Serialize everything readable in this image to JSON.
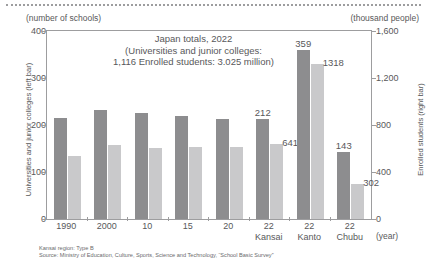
{
  "chart_data": {
    "type": "bar",
    "title": "Japan totals, 2022 (Universities and junior colleges: 1,116 Enrolled students: 3.025 million)",
    "title_lines": [
      "Japan totals, 2022",
      "(Universities and junior colleges:",
      "1,116 Enrolled students: 3.025 million)"
    ],
    "xlabel": "(year)",
    "unit_left": "(number of schools)",
    "unit_right": "(thousand people)",
    "ylabel_left": "Universities and junior colleges (left bar)",
    "ylabel_right": "Enrolled students (right bar)",
    "ylim_left": [
      0,
      400
    ],
    "ylim_right": [
      0,
      1600
    ],
    "yticks_left": [
      "0",
      "100",
      "200",
      "300",
      "400"
    ],
    "yticks_left_values": [
      0,
      100,
      200,
      300,
      400
    ],
    "yticks_right": [
      "0",
      "400",
      "800",
      "1,200",
      "1,600"
    ],
    "yticks_right_values": [
      0,
      400,
      800,
      1200,
      1600
    ],
    "grid": false,
    "legend_position": "none",
    "categories": [
      "1990",
      "2000",
      "10",
      "15",
      "20",
      "22",
      "22",
      "22"
    ],
    "category_sublabels": [
      "",
      "",
      "",
      "",
      "",
      "Kansai",
      "Kanto",
      "Chubu"
    ],
    "series": [
      {
        "name": "Universities and junior colleges (left bar)",
        "axis": "left",
        "color": "#8d8d8f",
        "values": [
          215,
          232,
          226,
          219,
          212,
          212,
          359,
          143
        ],
        "labels": [
          "",
          "",
          "",
          "",
          "",
          "212",
          "359",
          "143"
        ]
      },
      {
        "name": "Enrolled students (right bar)",
        "axis": "right",
        "color": "#c9c9cb",
        "values": [
          534,
          631,
          606,
          609,
          617,
          641,
          1318,
          302
        ],
        "labels": [
          "",
          "",
          "",
          "",
          "",
          "641",
          "1318",
          "302"
        ]
      }
    ],
    "annotations": [
      {
        "text": "359",
        "series": "left",
        "category_index": 6
      },
      {
        "text": "1318",
        "series": "right",
        "category_index": 6
      },
      {
        "text": "212",
        "series": "left",
        "category_index": 5
      },
      {
        "text": "641",
        "series": "right",
        "category_index": 5
      },
      {
        "text": "143",
        "series": "left",
        "category_index": 7
      },
      {
        "text": "302",
        "series": "right",
        "category_index": 7
      }
    ],
    "notes": [
      "Kansai region: Type B",
      "Source: Ministry of Education, Culture, Sports, Science and Technology, “School Basic Survey”"
    ],
    "colors": {
      "bar_dark": "#8d8d8f",
      "bar_light": "#c9c9cb",
      "axis": "#9d9d9f",
      "text": "#58585a"
    }
  }
}
